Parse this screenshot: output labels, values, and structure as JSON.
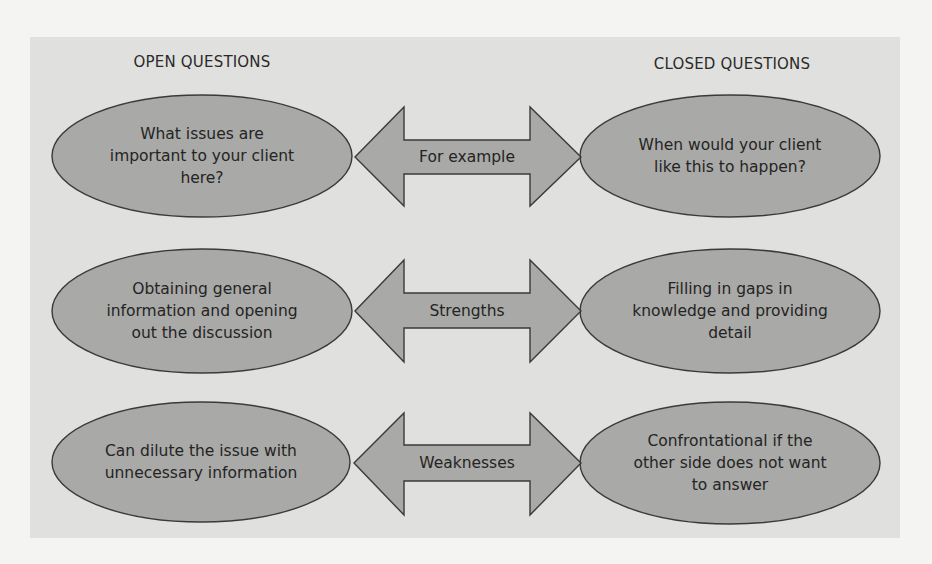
{
  "headings": {
    "left": "OPEN QUESTIONS",
    "right": "CLOSED QUESTIONS"
  },
  "colors": {
    "page_background": "#f4f4f2",
    "panel_background": "#e0e0de",
    "shape_fill": "#a9a9a7",
    "shape_stroke": "#3a3a3a",
    "text": "#242424"
  },
  "rows": [
    {
      "label": "For example",
      "open": {
        "lines": [
          "What issues are",
          "important to your client",
          "here?"
        ]
      },
      "closed": {
        "lines": [
          "When would your client",
          "like this to happen?"
        ]
      }
    },
    {
      "label": "Strengths",
      "open": {
        "lines": [
          "Obtaining general",
          "information and opening",
          "out the discussion"
        ]
      },
      "closed": {
        "lines": [
          "Filling in gaps in",
          "knowledge and providing",
          "detail"
        ]
      }
    },
    {
      "label": "Weaknesses",
      "open": {
        "lines": [
          "Can dilute the issue with",
          "unnecessary information"
        ]
      },
      "closed": {
        "lines": [
          "Confrontational if the",
          "other side does not want",
          "to answer"
        ]
      }
    }
  ]
}
